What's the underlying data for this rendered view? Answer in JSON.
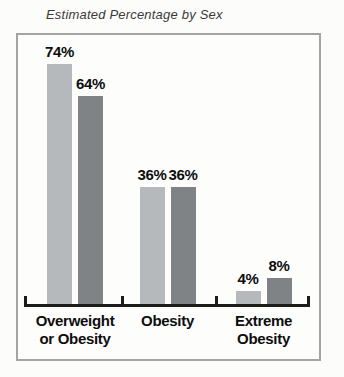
{
  "title": "Estimated Percentage by Sex",
  "chart_data": {
    "type": "bar",
    "title": "Estimated Percentage by Sex",
    "categories": [
      "Overweight or Obesity",
      "Obesity",
      "Extreme Obesity"
    ],
    "category_lines": [
      [
        "Overweight",
        "or Obesity"
      ],
      [
        "Obesity"
      ],
      [
        "Extreme",
        "Obesity"
      ]
    ],
    "series": [
      {
        "name": "series-light-gray",
        "color": "#b6b9bb",
        "values": [
          74,
          36,
          4
        ]
      },
      {
        "name": "series-dark-gray",
        "color": "#7f8386",
        "values": [
          64,
          36,
          8
        ]
      }
    ],
    "value_labels": [
      [
        "74%",
        "64%"
      ],
      [
        "36%",
        "36%"
      ],
      [
        "4%",
        "8%"
      ]
    ],
    "unit": "%",
    "ylim": [
      0,
      80
    ],
    "grid": false,
    "legend": "none",
    "axis_color": "#1c1c1c",
    "frame_color": "#a4a4a4",
    "label_color": "#0d0d0d"
  }
}
